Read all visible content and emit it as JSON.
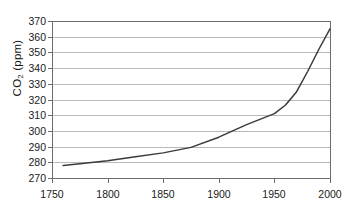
{
  "chart_data": {
    "type": "line",
    "title": "",
    "xlabel": "",
    "ylabel": "CO2 (ppm)",
    "ylabel_parts": {
      "base": "CO",
      "sub": "2",
      "unit": " (ppm)"
    },
    "xlim": [
      1750,
      2000
    ],
    "ylim": [
      270,
      370
    ],
    "grid": true,
    "legend": "none",
    "xticks": [
      1750,
      1800,
      1850,
      1900,
      1950,
      2000
    ],
    "xtick_labels": [
      "1750",
      "1800",
      "1850",
      "1900",
      "1950",
      "2000"
    ],
    "yticks": [
      270,
      280,
      290,
      300,
      310,
      320,
      330,
      340,
      350,
      360,
      370
    ],
    "ytick_labels": [
      "270",
      "280",
      "290",
      "300",
      "310",
      "320",
      "330",
      "340",
      "350",
      "360",
      "370"
    ],
    "series": [
      {
        "name": "Atmospheric CO2 concentration",
        "color": "#3a3a3a",
        "x": [
          1760,
          1775,
          1800,
          1825,
          1850,
          1875,
          1900,
          1925,
          1950,
          1960,
          1970,
          1980,
          1990,
          2000
        ],
        "values": [
          278.0,
          279.0,
          281.0,
          283.5,
          286.0,
          289.5,
          296.0,
          304.0,
          311.0,
          316.5,
          325.0,
          338.0,
          352.0,
          365.0
        ]
      }
    ]
  }
}
